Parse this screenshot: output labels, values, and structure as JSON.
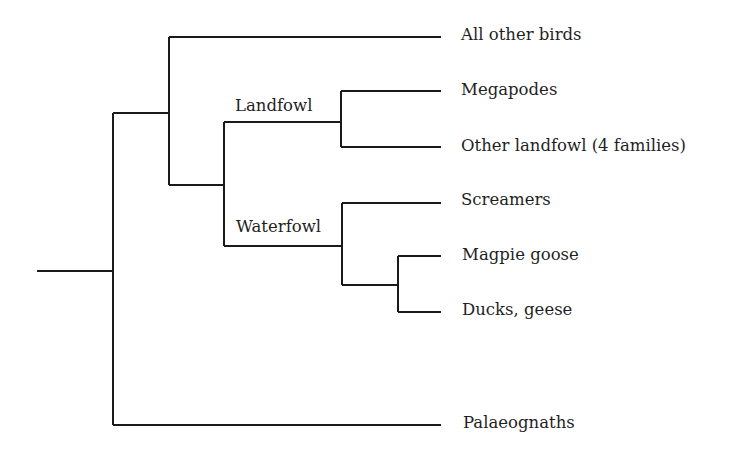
{
  "diagram": {
    "type": "phylogenetic-tree",
    "line_color": "#1a1a1a",
    "clade_labels": {
      "landfowl": "Landfowl",
      "waterfowl": "Waterfowl"
    },
    "leaves": [
      {
        "id": "all-other-birds",
        "label": "All other birds"
      },
      {
        "id": "megapodes",
        "label": "Megapodes"
      },
      {
        "id": "other-landfowl",
        "label": "Other landfowl (4 families)"
      },
      {
        "id": "screamers",
        "label": "Screamers"
      },
      {
        "id": "magpie-goose",
        "label": "Magpie goose"
      },
      {
        "id": "ducks-geese",
        "label": "Ducks, geese"
      },
      {
        "id": "palaeognaths",
        "label": "Palaeognaths"
      }
    ],
    "topology": "((All other birds,((Megapodes,Other landfowl)Landfowl,(Screamers,(Magpie goose,Ducks geese))Waterfowl)),Palaeognaths)"
  }
}
